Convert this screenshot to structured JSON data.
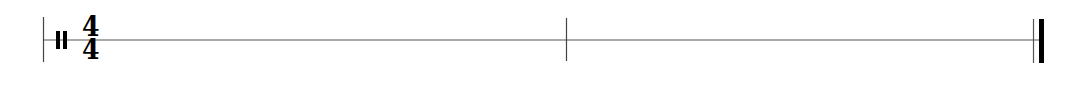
{
  "staff": {
    "type": "single-line percussion staff",
    "clef": "percussion-clef",
    "time_signature": {
      "numerator": "4",
      "denominator": "4"
    },
    "measures": 2,
    "barlines": [
      "start",
      "single",
      "final"
    ],
    "colors": {
      "ink": "#000000",
      "staff_line": "#555555",
      "background": "#ffffff"
    }
  }
}
